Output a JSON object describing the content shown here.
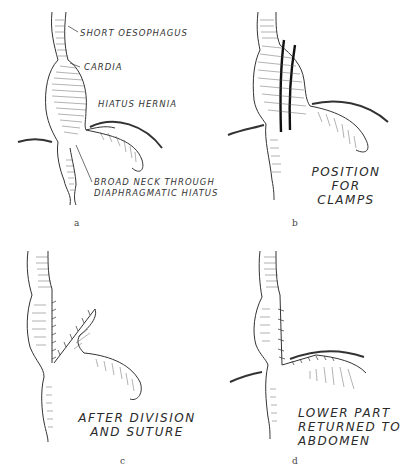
{
  "figure": {
    "panels": [
      {
        "id": "a",
        "letter": "a",
        "labels": {
          "short_oesophagus": "SHORT OESOPHAGUS",
          "cardia": "CARDIA",
          "hiatus_hernia": "HIATUS HERNIA",
          "broad_neck_1": "BROAD NECK THROUGH",
          "broad_neck_2": "DIAPHRAGMATIC HIATUS"
        }
      },
      {
        "id": "b",
        "letter": "b",
        "labels": {
          "line1": "POSITION",
          "line2": "FOR",
          "line3": "CLAMPS"
        }
      },
      {
        "id": "c",
        "letter": "c",
        "labels": {
          "line1": "AFTER DIVISION",
          "line2": "AND SUTURE"
        }
      },
      {
        "id": "d",
        "letter": "d",
        "labels": {
          "line1": "LOWER PART",
          "line2": "RETURNED TO",
          "line3": "ABDOMEN"
        }
      }
    ]
  }
}
